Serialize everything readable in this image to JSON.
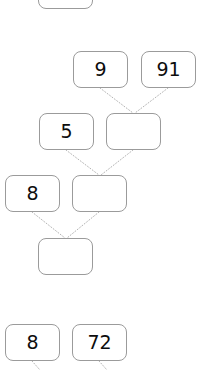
{
  "diagram": {
    "type": "tree-graph",
    "title": "",
    "canvas": {
      "width": 199,
      "height": 370,
      "background": "#ffffff"
    },
    "style": {
      "node_border_color": "#9b9b9b",
      "node_fill_color": "#ffffff",
      "node_text_color": "#0d0d0d",
      "edge_color": "#b4b4b4",
      "edge_style": "dotted",
      "node_corner_radius": 8,
      "node_border_width": 1
    },
    "nodes": [
      {
        "id": "n0",
        "label": "",
        "x": 38,
        "y": -28,
        "w": 55,
        "h": 37,
        "clipped": "top"
      },
      {
        "id": "n1",
        "label": "9",
        "x": 73,
        "y": 51,
        "w": 55,
        "h": 37,
        "clipped": "none"
      },
      {
        "id": "n2",
        "label": "91",
        "x": 141,
        "y": 51,
        "w": 55,
        "h": 37,
        "clipped": "none"
      },
      {
        "id": "n3",
        "label": "5",
        "x": 39,
        "y": 113,
        "w": 55,
        "h": 37,
        "clipped": "none"
      },
      {
        "id": "n4",
        "label": "",
        "x": 106,
        "y": 113,
        "w": 55,
        "h": 37,
        "clipped": "none"
      },
      {
        "id": "n5",
        "label": "8",
        "x": 5,
        "y": 175,
        "w": 55,
        "h": 37,
        "clipped": "none"
      },
      {
        "id": "n6",
        "label": "",
        "x": 72,
        "y": 175,
        "w": 55,
        "h": 37,
        "clipped": "none"
      },
      {
        "id": "n7",
        "label": "",
        "x": 38,
        "y": 238,
        "w": 55,
        "h": 37,
        "clipped": "none"
      },
      {
        "id": "n8",
        "label": "8",
        "x": 5,
        "y": 324,
        "w": 55,
        "h": 37,
        "clipped": "none"
      },
      {
        "id": "n9",
        "label": "72",
        "x": 72,
        "y": 324,
        "w": 55,
        "h": 37,
        "clipped": "none"
      }
    ],
    "edges": [
      {
        "id": "e1",
        "from": "n1",
        "to": "n4",
        "x1": 100,
        "y1": 88,
        "x2": 133,
        "y2": 113
      },
      {
        "id": "e2",
        "from": "n2",
        "to": "n4",
        "x1": 168,
        "y1": 88,
        "x2": 135,
        "y2": 113
      },
      {
        "id": "e3",
        "from": "n3",
        "to": "n6",
        "x1": 66,
        "y1": 150,
        "x2": 99,
        "y2": 175
      },
      {
        "id": "e4",
        "from": "n4",
        "to": "n6",
        "x1": 133,
        "y1": 150,
        "x2": 101,
        "y2": 175
      },
      {
        "id": "e5",
        "from": "n5",
        "to": "n7",
        "x1": 32,
        "y1": 212,
        "x2": 65,
        "y2": 238
      },
      {
        "id": "e6",
        "from": "n6",
        "to": "n7",
        "x1": 99,
        "y1": 212,
        "x2": 67,
        "y2": 238
      },
      {
        "id": "e7",
        "from": "n8",
        "to": "below",
        "x1": 32,
        "y1": 361,
        "x2": 40,
        "y2": 370
      },
      {
        "id": "e8",
        "from": "n9",
        "to": "below",
        "x1": 99,
        "y1": 361,
        "x2": 107,
        "y2": 370
      }
    ]
  }
}
